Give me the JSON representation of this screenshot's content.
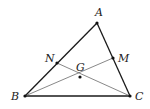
{
  "diagram": {
    "type": "geometry",
    "colors": {
      "stroke": "#1a1a1a",
      "thin_stroke": "#555555",
      "point": "#111111",
      "label": "#222222"
    },
    "points": [
      {
        "id": "A",
        "label": "A",
        "x": 97,
        "y": 23,
        "lx": 95,
        "ly": 16
      },
      {
        "id": "B",
        "label": "B",
        "x": 25,
        "y": 96,
        "lx": 11,
        "ly": 100
      },
      {
        "id": "C",
        "label": "C",
        "x": 130,
        "y": 96,
        "lx": 135,
        "ly": 100
      },
      {
        "id": "N",
        "label": "N",
        "x": 57,
        "y": 63,
        "lx": 45,
        "ly": 62
      },
      {
        "id": "M",
        "label": "M",
        "x": 113,
        "y": 58,
        "lx": 118,
        "ly": 62
      },
      {
        "id": "G",
        "label": "G",
        "x": 80,
        "y": 77,
        "lx": 76,
        "ly": 71
      }
    ],
    "segments": [
      {
        "from": "A",
        "to": "B",
        "weight": "thick"
      },
      {
        "from": "A",
        "to": "C",
        "weight": "thick"
      },
      {
        "from": "B",
        "to": "C",
        "weight": "thick"
      },
      {
        "from": "B",
        "to": "M",
        "weight": "thin"
      },
      {
        "from": "C",
        "to": "N",
        "weight": "thin"
      }
    ]
  }
}
